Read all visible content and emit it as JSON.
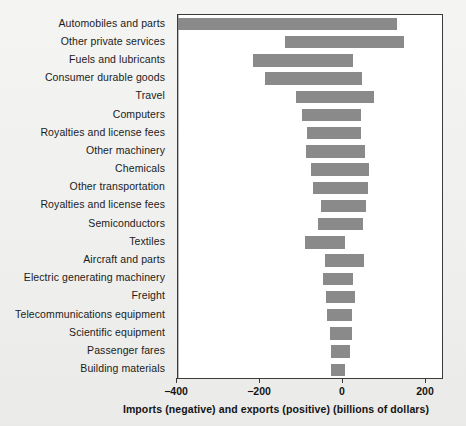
{
  "chart_data": {
    "type": "bar",
    "orientation": "horizontal",
    "title": "",
    "xlabel": "Imports (negative) and exports (positive) (billions of dollars)",
    "ylabel": "",
    "xlim": [
      -400,
      260
    ],
    "xticks": [
      -400,
      -200,
      0,
      200
    ],
    "xtick_labels": [
      "−400",
      "−200",
      "0",
      "200"
    ],
    "grid": false,
    "legend": null,
    "zero_reference_line": true,
    "bar_color": "#8a8a8a",
    "categories": [
      "Automobiles and parts",
      "Other private services",
      "Fuels and lubricants",
      "Consumer durable goods",
      "Travel",
      "Computers",
      "Royalties and license fees",
      "Other machinery",
      "Chemicals",
      "Other transportation",
      "Royalties and license fees",
      "Semiconductors",
      "Textiles",
      "Aircraft and parts",
      "Electric generating machinery",
      "Freight",
      "Telecommunications equipment",
      "Scientific equipment",
      "Passenger fares",
      "Building materials"
    ],
    "imports": [
      -397,
      -140,
      -216,
      -188,
      -114,
      -100,
      -86,
      -88,
      -78,
      -72,
      -52,
      -60,
      -92,
      -44,
      -48,
      -40,
      -38,
      -32,
      -30,
      -28
    ],
    "exports": [
      130,
      147,
      24,
      46,
      74,
      44,
      44,
      54,
      62,
      60,
      56,
      48,
      4,
      50,
      24,
      28,
      22,
      22,
      16,
      4
    ],
    "series": [
      {
        "name": "Imports (negative)",
        "values": [
          -397,
          -140,
          -216,
          -188,
          -114,
          -100,
          -86,
          -88,
          -78,
          -72,
          -52,
          -60,
          -92,
          -44,
          -48,
          -40,
          -38,
          -32,
          -30,
          -28
        ]
      },
      {
        "name": "Exports (positive)",
        "values": [
          130,
          147,
          24,
          46,
          74,
          44,
          44,
          54,
          62,
          60,
          56,
          48,
          4,
          50,
          24,
          28,
          22,
          22,
          16,
          4
        ]
      }
    ]
  }
}
